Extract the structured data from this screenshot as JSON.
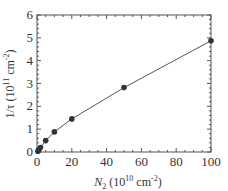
{
  "chart_data": {
    "type": "line",
    "title": "",
    "xlabel": "N_2 (10^10 cm^-2)",
    "ylabel": "1/τ (10^11 cm^-2)",
    "xlim": [
      0,
      100
    ],
    "ylim": [
      0,
      6
    ],
    "grid": false,
    "legend": null,
    "x_ticks": [
      0,
      20,
      40,
      60,
      80,
      100
    ],
    "y_ticks": [
      0,
      1,
      2,
      3,
      4,
      5,
      6
    ],
    "series": [
      {
        "name": "data",
        "marker": "filled-circle",
        "line": "solid",
        "color": "#333333",
        "x": [
          0.5,
          1,
          2,
          5,
          10,
          20,
          50,
          100
        ],
        "y": [
          0.03,
          0.08,
          0.2,
          0.5,
          0.88,
          1.45,
          2.82,
          4.87
        ]
      }
    ]
  },
  "labels": {
    "x_main_italic": "N",
    "x_sub": "2",
    "x_unit_open": " (10",
    "x_unit_exp": "10",
    "x_unit_mid": " cm",
    "x_unit_exp2": "-2",
    "x_unit_close": ")",
    "y_main": "1/τ (10",
    "y_exp": "11",
    "y_mid": " cm",
    "y_exp2": "-2",
    "y_close": ")"
  }
}
